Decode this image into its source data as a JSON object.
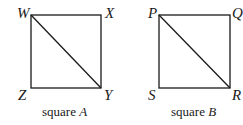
{
  "diagram": {
    "squares": [
      {
        "name": "A",
        "caption_prefix": "square ",
        "caption_var": "A",
        "vertices": {
          "top_left": {
            "label": "W",
            "x": 31,
            "y": 15
          },
          "top_right": {
            "label": "X",
            "x": 101,
            "y": 15
          },
          "bottom_right": {
            "label": "Y",
            "x": 101,
            "y": 88
          },
          "bottom_left": {
            "label": "Z",
            "x": 31,
            "y": 88
          }
        },
        "diagonal": [
          "W",
          "Y"
        ]
      },
      {
        "name": "B",
        "caption_prefix": "square ",
        "caption_var": "B",
        "vertices": {
          "top_left": {
            "label": "P",
            "x": 159,
            "y": 15
          },
          "top_right": {
            "label": "Q",
            "x": 230,
            "y": 15
          },
          "bottom_right": {
            "label": "R",
            "x": 230,
            "y": 88
          },
          "bottom_left": {
            "label": "S",
            "x": 159,
            "y": 88
          }
        },
        "diagonal": [
          "P",
          "R"
        ]
      }
    ],
    "stroke_color": "#1a1a1a",
    "background": "#ffffff"
  }
}
